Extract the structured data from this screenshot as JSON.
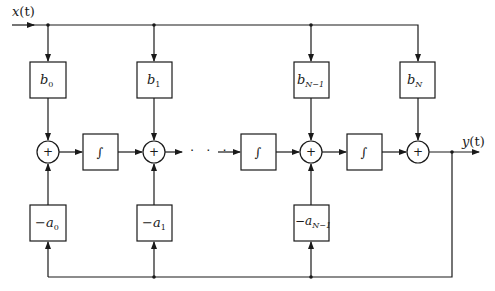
{
  "diagram": {
    "input_label": {
      "name": "x",
      "arg": "(t)"
    },
    "output_label": {
      "name": "y",
      "arg": "(t)"
    },
    "feedforward_gains": [
      {
        "symbol": "b",
        "subscript": "0"
      },
      {
        "symbol": "b",
        "subscript": "1"
      },
      {
        "symbol": "b",
        "subscript": "N−1"
      },
      {
        "symbol": "b",
        "subscript": "N"
      }
    ],
    "feedback_gains": [
      {
        "symbol": "−a",
        "subscript": "0"
      },
      {
        "symbol": "−a",
        "subscript": "1"
      },
      {
        "symbol": "−a",
        "subscript": "N−1"
      }
    ],
    "summer_symbol": "+",
    "integrator_symbol": "∫",
    "ellipsis": "· · ·",
    "colors": {
      "line": "#1a1a1a",
      "background": "#ffffff"
    }
  }
}
